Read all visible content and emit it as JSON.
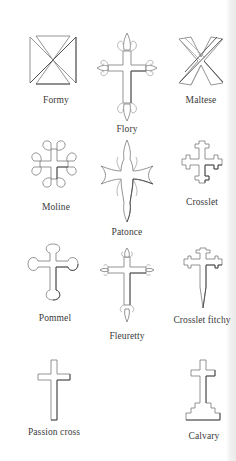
{
  "page": {
    "background": "#ffffff",
    "line_color": "#7a7a7a",
    "label_color": "#3a3a3a"
  },
  "crosses": [
    {
      "name": "Formy",
      "icon": "cross-formy-icon"
    },
    {
      "name": "Flory",
      "icon": "cross-flory-icon"
    },
    {
      "name": "Maltese",
      "icon": "cross-maltese-icon"
    },
    {
      "name": "Moline",
      "icon": "cross-moline-icon"
    },
    {
      "name": "Patonce",
      "icon": "cross-patonce-icon"
    },
    {
      "name": "Crosslet",
      "icon": "cross-crosslet-icon"
    },
    {
      "name": "Pommel",
      "icon": "cross-pommel-icon"
    },
    {
      "name": "Fleuretty",
      "icon": "cross-fleuretty-icon"
    },
    {
      "name": "Crosslet fitchy",
      "icon": "cross-crosslet-fitchy-icon"
    },
    {
      "name": "Passion cross",
      "icon": "cross-passion-icon"
    },
    {
      "name": "Calvary",
      "icon": "cross-calvary-icon"
    }
  ]
}
